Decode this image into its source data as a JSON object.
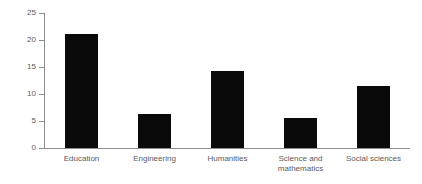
{
  "chart_data": {
    "type": "bar",
    "title": "",
    "subtitle": "",
    "xlabel": "",
    "ylabel": "Percent",
    "categories": [
      "Education",
      "Engineering",
      "Humanities",
      "Science and\nmathematics",
      "Social sciences"
    ],
    "values": [
      21.2,
      6.3,
      14.3,
      5.5,
      11.5
    ],
    "ylim": [
      0,
      25
    ],
    "yticks": [
      0,
      5,
      10,
      15,
      20,
      25
    ],
    "ytick_labels": [
      "0",
      "5",
      "10",
      "15",
      "20",
      "25"
    ],
    "grid": false,
    "legend": false,
    "legend_position": "none",
    "bar_color": "#0a0a0a",
    "axis_color": "#8c8c8c",
    "text_color": "#5a5a5a",
    "background_color": "#ffffff"
  }
}
